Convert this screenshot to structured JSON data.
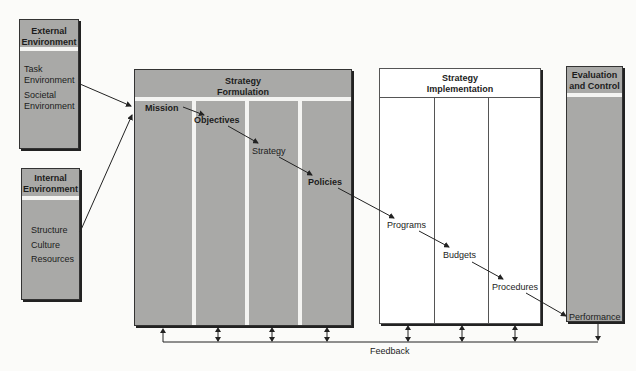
{
  "external": {
    "title_l1": "External",
    "title_l2": "Environment",
    "items": [
      "Task",
      "Environment",
      "Societal",
      "Environment"
    ]
  },
  "internal": {
    "title_l1": "Internal",
    "title_l2": "Environment",
    "items": [
      "Structure",
      "Culture",
      "Resources"
    ]
  },
  "formulation": {
    "title_l1": "Strategy",
    "title_l2": "Formulation",
    "steps": [
      "Mission",
      "Objectives",
      "Strategy",
      "Policies"
    ]
  },
  "implementation": {
    "title_l1": "Strategy",
    "title_l2": "Implementation",
    "steps": [
      "Programs",
      "Budgets",
      "Procedures"
    ]
  },
  "evaluation": {
    "title_l1": "Evaluation",
    "title_l2": "and Control",
    "steps": [
      "Performance"
    ]
  },
  "feedback": {
    "label": "Feedback"
  },
  "colors": {
    "box_gray": "#a9a9a7",
    "line": "#222222"
  }
}
